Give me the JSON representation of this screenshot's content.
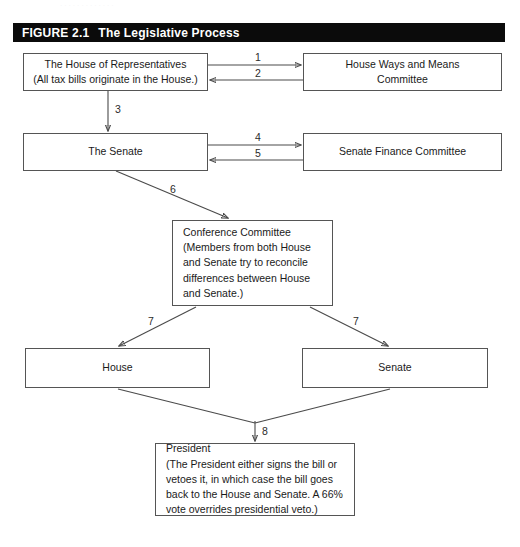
{
  "figure": {
    "number": "FIGURE 2.1",
    "title": "The Legislative Process",
    "header_bg": "#0b0b0b",
    "header_fg": "#ffffff"
  },
  "nodes": {
    "house_reps": "The House of Representatives\n(All tax bills originate in the House.)",
    "ways_means": "House Ways and Means\nCommittee",
    "senate_top": "The Senate",
    "senate_finance": "Senate Finance Committee",
    "conference": "Conference Committee\n(Members from both House\nand Senate try to reconcile\ndifferences between House\nand Senate.)",
    "house_bottom": "House",
    "senate_bottom": "Senate",
    "president": "President\n(The President either signs the bill or\nvetoes it, in which case the bill goes\nback to the House and Senate. A 66%\nvote overrides presidential veto.)"
  },
  "edges": [
    {
      "id": "1",
      "label": "1",
      "from": "house_reps",
      "to": "ways_means",
      "direction": "right"
    },
    {
      "id": "2",
      "label": "2",
      "from": "ways_means",
      "to": "house_reps",
      "direction": "left"
    },
    {
      "id": "3",
      "label": "3",
      "from": "house_reps",
      "to": "senate_top",
      "direction": "down"
    },
    {
      "id": "4",
      "label": "4",
      "from": "senate_top",
      "to": "senate_finance",
      "direction": "right"
    },
    {
      "id": "5",
      "label": "5",
      "from": "senate_finance",
      "to": "senate_top",
      "direction": "left"
    },
    {
      "id": "6",
      "label": "6",
      "from": "senate_top",
      "to": "conference",
      "direction": "diagonal-down-right"
    },
    {
      "id": "7a",
      "label": "7",
      "from": "conference",
      "to": "house_bottom",
      "direction": "diagonal-down-left"
    },
    {
      "id": "7b",
      "label": "7",
      "from": "conference",
      "to": "senate_bottom",
      "direction": "diagonal-down-right"
    },
    {
      "id": "8",
      "label": "8",
      "from": "house_bottom_and_senate_bottom",
      "to": "president",
      "direction": "down"
    }
  ],
  "colors": {
    "stroke": "#4a4a4a",
    "box_border": "#555555",
    "text": "#1a1a1a",
    "page_bg": "#ffffff"
  },
  "scan_artifact": "·  ·   ·    ·   ·    ·  ·     ·   ·   ·    ·     ·   ·"
}
